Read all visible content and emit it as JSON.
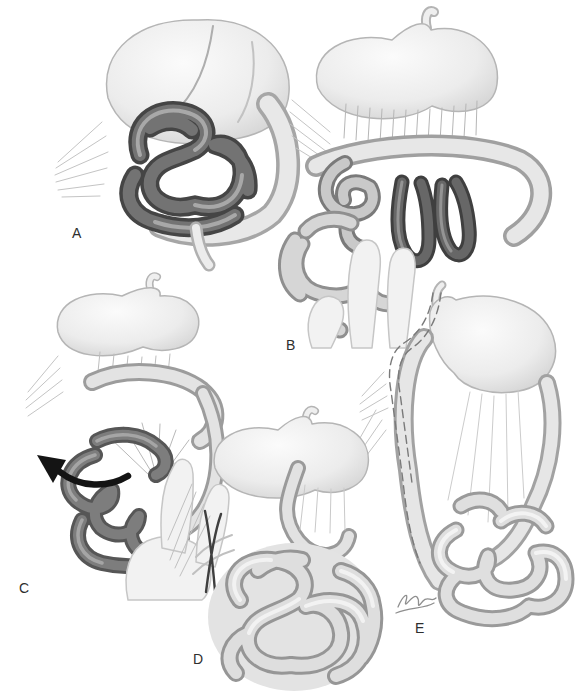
{
  "figure": {
    "background": "#ffffff"
  },
  "panels": [
    {
      "label": "A"
    },
    {
      "label": "B"
    },
    {
      "label": "C"
    },
    {
      "label": "D"
    },
    {
      "label": "E"
    }
  ],
  "icons": {
    "detorsion_arrow": "curved-arrow-counterclockwise",
    "scissors": "surgical-scissors",
    "signature": "artist-signature-scribble"
  },
  "colors": {
    "label_text": "#2e2e2e",
    "arrow_black": "#141414",
    "ink_dark": "#3f3f3f",
    "bowel_dark": "#454545",
    "bowel_mid": "#969696",
    "organ_light": "#ececec",
    "organ_edge": "#b5b5b5",
    "dashed_line": "#7a7a7a"
  }
}
